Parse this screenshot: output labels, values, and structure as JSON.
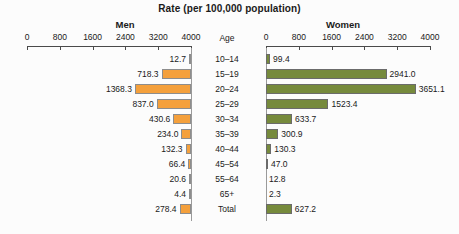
{
  "chart_data": {
    "type": "bar",
    "title": "Rate (per 100,000 population)",
    "subtype": "population-pyramid",
    "orientation": "horizontal-bidirectional",
    "categories": [
      "10–14",
      "15–19",
      "20–24",
      "25–29",
      "30–34",
      "35–39",
      "40–44",
      "45–54",
      "55–64",
      "65+",
      "Total"
    ],
    "category_axis_label": "Age",
    "xlabel": "Rate (per 100,000 population)",
    "ylabel": "Age",
    "grid": false,
    "legend_position": "none",
    "series": [
      {
        "name": "Men",
        "color": "#f4a03c",
        "side": "left",
        "values": [
          12.7,
          718.3,
          1368.3,
          837.0,
          430.6,
          234.0,
          132.3,
          66.4,
          20.6,
          4.4,
          278.4
        ],
        "labels": [
          "12.7",
          "718.3",
          "1368.3",
          "837.0",
          "430.6",
          "234.0",
          "132.3",
          "66.4",
          "20.6",
          "4.4",
          "278.4"
        ],
        "axis_ticks": [
          4000,
          3200,
          2400,
          1600,
          800,
          0
        ],
        "axis_tick_labels": [
          "4000",
          "3200",
          "2400",
          "1600",
          "800",
          "0"
        ],
        "xlim": [
          0,
          4000
        ]
      },
      {
        "name": "Women",
        "color": "#768a3c",
        "side": "right",
        "values": [
          99.4,
          2941.0,
          3651.1,
          1523.4,
          633.7,
          300.9,
          130.3,
          47.0,
          12.8,
          2.3,
          627.2
        ],
        "labels": [
          "99.4",
          "2941.0",
          "3651.1",
          "1523.4",
          "633.7",
          "300.9",
          "130.3",
          "47.0",
          "12.8",
          "2.3",
          "627.2"
        ],
        "axis_ticks": [
          0,
          800,
          1600,
          2400,
          3200,
          4000
        ],
        "axis_tick_labels": [
          "0",
          "800",
          "1600",
          "2400",
          "3200",
          "4000"
        ],
        "xlim": [
          0,
          4000
        ]
      }
    ]
  },
  "colors": {
    "men_bar": "#f4a03c",
    "women_bar": "#768a3c",
    "axis": "#4a4a4a",
    "background": "#fcfcfc",
    "text": "#1a1a1a"
  }
}
